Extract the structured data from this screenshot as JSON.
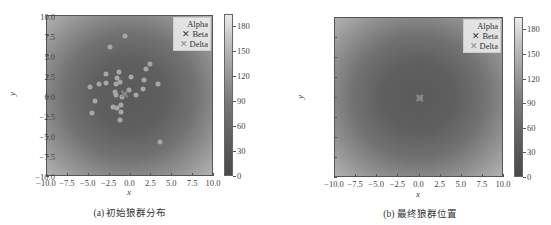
{
  "chart_data": [
    {
      "type": "scatter",
      "panel": "a",
      "caption": "(a) 初始狼群分布",
      "xlabel": "x",
      "ylabel": "y",
      "xlim": [
        -10,
        10
      ],
      "ylim": [
        -10,
        10
      ],
      "xticks": [
        "−10.0",
        "−7.5",
        "−5.0",
        "−2.5",
        "0.0",
        "2.5",
        "5.0",
        "7.5",
        "10.0"
      ],
      "yticks": [
        "10.0",
        "7.5",
        "5.0",
        "2.5",
        "0.0",
        "−2.5",
        "−5.0",
        "−7.5",
        "−10.0"
      ],
      "background": "heatmap (radial, low at center, high at corners)",
      "colorbar": {
        "ticks": [
          "0",
          "30",
          "60",
          "90",
          "120",
          "150",
          "180"
        ],
        "range": [
          0,
          195
        ]
      },
      "legend": {
        "position": "upper right",
        "entries": [
          "Alpha",
          "Beta",
          "Delta"
        ]
      },
      "series": [
        {
          "name": "wolves",
          "marker": "circle",
          "color": "#a6a6a6",
          "points": [
            [
              -0.6,
              7.5
            ],
            [
              -2.4,
              6.1
            ],
            [
              2.3,
              4.0
            ],
            [
              1.8,
              3.4
            ],
            [
              -1.4,
              3.1
            ],
            [
              -2.9,
              2.8
            ],
            [
              0.1,
              2.4
            ],
            [
              -1.6,
              2.3
            ],
            [
              1.6,
              2.1
            ],
            [
              -3.8,
              1.6
            ],
            [
              -2.9,
              1.7
            ],
            [
              -1.2,
              1.8
            ],
            [
              -1.7,
              1.5
            ],
            [
              3.3,
              1.5
            ],
            [
              -4.9,
              1.2
            ],
            [
              1.5,
              0.9
            ],
            [
              -0.2,
              0.8
            ],
            [
              -1.9,
              0.6
            ],
            [
              -1.7,
              0.2
            ],
            [
              0.7,
              0.2
            ],
            [
              -1.0,
              -0.1
            ],
            [
              -4.3,
              -0.6
            ],
            [
              -2.1,
              -1.3
            ],
            [
              -1.6,
              -1.4
            ],
            [
              -1.1,
              -1.1
            ],
            [
              -1.1,
              -1.9
            ],
            [
              -4.6,
              -2.1
            ],
            [
              -1.2,
              -2.9
            ],
            [
              3.5,
              -5.7
            ]
          ]
        },
        {
          "name": "Alpha",
          "marker": "x",
          "color": "#ffffff",
          "points": [
            [
              -0.7,
              0.3
            ]
          ]
        },
        {
          "name": "Beta",
          "marker": "x",
          "color": "#333333",
          "points": [
            [
              -0.7,
              0.3
            ]
          ]
        },
        {
          "name": "Delta",
          "marker": "x",
          "color": "#888888",
          "points": [
            [
              -0.7,
              0.3
            ]
          ]
        }
      ]
    },
    {
      "type": "scatter",
      "panel": "b",
      "caption": "(b) 最终狼群位置",
      "xlabel": "x",
      "ylabel": "y",
      "xlim": [
        -10,
        10
      ],
      "ylim": [
        -10,
        10
      ],
      "xticks": [
        "−10.0",
        "−7.5",
        "−5.0",
        "−2.5",
        "0.0",
        "2.5",
        "5.0",
        "7.5",
        "10.0"
      ],
      "yticks": [
        "10.0",
        "7.5",
        "5.0",
        "2.5",
        "0.0",
        "−2.5",
        "−5.0",
        "−7.5",
        "−10.0"
      ],
      "background": "heatmap (radial, low at center, high at corners)",
      "colorbar": {
        "ticks": [
          "0",
          "30",
          "60",
          "90",
          "120",
          "150",
          "180"
        ],
        "range": [
          0,
          195
        ]
      },
      "legend": {
        "position": "upper right",
        "entries": [
          "Alpha",
          "Beta",
          "Delta"
        ]
      },
      "series": [
        {
          "name": "wolves",
          "marker": "circle",
          "color": "#a6a6a6",
          "points": [
            [
              0.0,
              0.0
            ]
          ]
        },
        {
          "name": "Alpha",
          "marker": "x",
          "color": "#ffffff",
          "points": [
            [
              0.0,
              0.0
            ]
          ]
        },
        {
          "name": "Beta",
          "marker": "x",
          "color": "#333333",
          "points": [
            [
              0.0,
              0.0
            ]
          ]
        },
        {
          "name": "Delta",
          "marker": "x",
          "color": "#888888",
          "points": [
            [
              0.0,
              0.0
            ]
          ]
        }
      ]
    }
  ],
  "legend_labels": {
    "alpha": "Alpha",
    "beta": "Beta",
    "delta": "Delta"
  },
  "legend_markers": {
    "alpha": "",
    "beta": "✕",
    "delta": "✕"
  },
  "captions": {
    "a": "(a) 初始狼群分布",
    "b": "(b) 最终狼群位置"
  },
  "axis_labels": {
    "x": "x",
    "y": "y"
  }
}
